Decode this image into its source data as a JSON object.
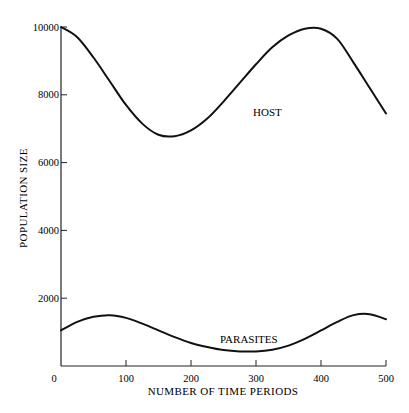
{
  "chart_data": {
    "type": "line",
    "title": "",
    "xlabel": "NUMBER OF TIME PERIODS",
    "ylabel": "POPULATION SIZE",
    "xlim": [
      0,
      500
    ],
    "ylim": [
      0,
      10000
    ],
    "x_ticks": [
      0,
      100,
      200,
      300,
      400,
      500
    ],
    "y_ticks": [
      0,
      2000,
      4000,
      6000,
      8000,
      10000
    ],
    "x_tick_labels": [
      "0",
      "100",
      "200",
      "300",
      "400",
      "500"
    ],
    "y_tick_labels": [
      "2000",
      "4000",
      "6000",
      "8000",
      "10000"
    ],
    "grid": false,
    "legend": "inline labels",
    "x": [
      0,
      25,
      50,
      75,
      100,
      125,
      150,
      175,
      200,
      225,
      250,
      275,
      300,
      325,
      350,
      375,
      400,
      425,
      450,
      475,
      500
    ],
    "series": [
      {
        "name": "HOST",
        "values": [
          10000,
          9700,
          9100,
          8400,
          7700,
          7150,
          6820,
          6780,
          6950,
          7300,
          7800,
          8350,
          8900,
          9400,
          9750,
          9950,
          9950,
          9650,
          8950,
          8200,
          7450
        ]
      },
      {
        "name": "PARASITES",
        "values": [
          1050,
          1300,
          1450,
          1500,
          1420,
          1250,
          1050,
          850,
          680,
          560,
          470,
          430,
          430,
          480,
          600,
          800,
          1050,
          1300,
          1500,
          1530,
          1380
        ]
      }
    ],
    "annotations": [
      {
        "text": "HOST",
        "x": 255,
        "y": 7100
      },
      {
        "text": "PARASITES",
        "x": 270,
        "y": 700
      }
    ]
  },
  "labels": {
    "host": "HOST",
    "parasites": "PARASITES",
    "xlabel": "NUMBER OF TIME PERIODS",
    "ylabel": "POPULATION SIZE"
  },
  "colors": {
    "line": "#111111",
    "axis": "#222222",
    "background": "#ffffff"
  }
}
